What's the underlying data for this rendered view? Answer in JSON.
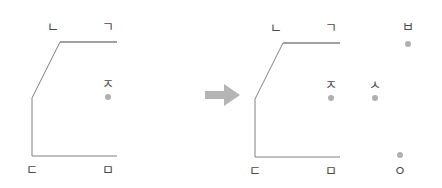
{
  "figure": {
    "background_color": "#ffffff",
    "line_color": "#808080",
    "glyph_color": "#4a4a4a",
    "dot_color": "#b0b0b0",
    "arrow_color": "#b5b5b5"
  },
  "transition": {
    "arrow_icon": "arrow-right-icon",
    "label": ""
  },
  "panels": [
    {
      "id": "before",
      "name": "before-panel",
      "polyline": {
        "points": "60,42 117,42 60,42 32,98 32,98 32,156 117,156",
        "vertices": [
          {
            "x": 117,
            "y": 42
          },
          {
            "x": 48,
            "y": 42
          },
          {
            "x": 70,
            "y": 98
          },
          {
            "x": 32,
            "y": 156
          },
          {
            "x": 117,
            "y": 156
          }
        ]
      },
      "markers": [
        {
          "id": "n",
          "glyph": "ㄴ",
          "name": "marker-nieun",
          "x": 53,
          "y": 27,
          "dot": false
        },
        {
          "id": "g",
          "glyph": "ㄱ",
          "name": "marker-giyeok",
          "x": 108,
          "y": 27,
          "dot": false
        },
        {
          "id": "j",
          "glyph": "ㅈ",
          "name": "marker-jieut",
          "x": 108,
          "y": 84,
          "dot": true,
          "dot_x": 108,
          "dot_y": 97,
          "dot_pos": "below"
        },
        {
          "id": "d",
          "glyph": "ㄷ",
          "name": "marker-digeut",
          "x": 32,
          "y": 170,
          "dot": false
        },
        {
          "id": "m",
          "glyph": "ㅁ",
          "name": "marker-mieum",
          "x": 108,
          "y": 170,
          "dot": false
        }
      ]
    },
    {
      "id": "after",
      "name": "after-panel",
      "polyline": {
        "points": "62,43 119,43 62,43 34,99 34,99 34,157 119,157",
        "vertices": [
          {
            "x": 119,
            "y": 43
          },
          {
            "x": 50,
            "y": 43
          },
          {
            "x": 72,
            "y": 99
          },
          {
            "x": 34,
            "y": 157
          },
          {
            "x": 119,
            "y": 157
          }
        ]
      },
      "markers": [
        {
          "id": "n",
          "glyph": "ㄴ",
          "name": "marker-nieun",
          "x": 55,
          "y": 28,
          "dot": false
        },
        {
          "id": "g",
          "glyph": "ㄱ",
          "name": "marker-giyeok",
          "x": 110,
          "y": 28,
          "dot": false
        },
        {
          "id": "b",
          "glyph": "ㅂ",
          "name": "marker-bieup",
          "x": 187,
          "y": 27,
          "dot": true,
          "dot_x": 187,
          "dot_y": 44,
          "dot_pos": "below"
        },
        {
          "id": "j",
          "glyph": "ㅈ",
          "name": "marker-jieut",
          "x": 110,
          "y": 85,
          "dot": true,
          "dot_x": 110,
          "dot_y": 98,
          "dot_pos": "below"
        },
        {
          "id": "s",
          "glyph": "ㅅ",
          "name": "marker-siot",
          "x": 154,
          "y": 85,
          "dot": true,
          "dot_x": 154,
          "dot_y": 98,
          "dot_pos": "below"
        },
        {
          "id": "d",
          "glyph": "ㄷ",
          "name": "marker-digeut",
          "x": 34,
          "y": 171,
          "dot": false
        },
        {
          "id": "m",
          "glyph": "ㅁ",
          "name": "marker-mieum",
          "x": 110,
          "y": 171,
          "dot": false
        },
        {
          "id": "o",
          "glyph": "ㅇ",
          "name": "marker-ieung",
          "x": 179,
          "y": 171,
          "dot": true,
          "dot_x": 179,
          "dot_y": 155,
          "dot_pos": "above"
        }
      ]
    }
  ]
}
